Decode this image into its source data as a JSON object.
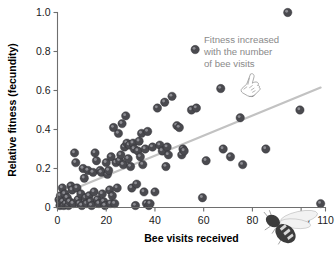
{
  "figure": {
    "name": "bee-visits-fitness-scatterplot",
    "background_color": "#ffffff",
    "point_color": "#4a4a4f",
    "trendline_color": "#c2c2c2",
    "annotation_color": "#8a8a8a",
    "axis_color": "#6e6e6e"
  },
  "annotation": {
    "line1": "Fitness increased",
    "line2": "with the number",
    "line3": "of bee visits",
    "pointer_icon": "pointing-hand-icon"
  },
  "decorations": {
    "bee_icon": "bee-illustration-icon"
  },
  "chart_data": {
    "type": "scatter",
    "title": "",
    "xlabel": "Bee visits received",
    "ylabel": "Relative fitness (fecundity)",
    "xlim": [
      0,
      110
    ],
    "ylim": [
      0,
      1.0
    ],
    "xticks": [
      0,
      20,
      40,
      60,
      80,
      100,
      110
    ],
    "xtick_labels": [
      "0",
      "20",
      "40",
      "60",
      "80",
      "100",
      "110"
    ],
    "yticks": [
      0,
      0.2,
      0.4,
      0.6,
      0.8,
      1.0
    ],
    "ytick_labels": [
      "0",
      "0.2",
      "0.4",
      "0.6",
      "0.8",
      "1.0"
    ],
    "grid": false,
    "legend": false,
    "marker": "filled-circle",
    "marker_size": 4.2,
    "trendline": {
      "type": "linear-fit",
      "x_start": 0,
      "y_start": 0.06,
      "x_end": 108,
      "y_end": 0.615,
      "color": "#c2c2c2"
    },
    "points": [
      [
        0.6,
        0.04
      ],
      [
        1.0,
        0.01
      ],
      [
        1.2,
        0.06
      ],
      [
        1.5,
        0.02
      ],
      [
        2.0,
        0.1
      ],
      [
        2.2,
        0.03
      ],
      [
        2.6,
        0.01
      ],
      [
        3.0,
        0.07
      ],
      [
        3.4,
        0.02
      ],
      [
        4.0,
        0.05
      ],
      [
        4.5,
        0.01
      ],
      [
        5.0,
        0.03
      ],
      [
        5.5,
        0.11
      ],
      [
        6.0,
        0.09
      ],
      [
        6.4,
        0.02
      ],
      [
        7.0,
        0.28
      ],
      [
        7.5,
        0.23
      ],
      [
        8.0,
        0.1
      ],
      [
        8.4,
        0.04
      ],
      [
        9.0,
        0.02
      ],
      [
        9.6,
        0.07
      ],
      [
        10.0,
        0.01
      ],
      [
        10.5,
        0.2
      ],
      [
        11.0,
        0.15
      ],
      [
        11.6,
        0.05
      ],
      [
        12.0,
        0.02
      ],
      [
        12.5,
        0.19
      ],
      [
        13.0,
        0.06
      ],
      [
        13.5,
        0.03
      ],
      [
        14.0,
        0.01
      ],
      [
        14.6,
        0.18
      ],
      [
        15.0,
        0.08
      ],
      [
        15.4,
        0.28
      ],
      [
        16.0,
        0.24
      ],
      [
        16.4,
        0.04
      ],
      [
        17.0,
        0.02
      ],
      [
        17.5,
        0.19
      ],
      [
        18.0,
        0.18
      ],
      [
        18.4,
        0.07
      ],
      [
        19.0,
        0.03
      ],
      [
        19.5,
        0.01
      ],
      [
        20.0,
        0.23
      ],
      [
        20.5,
        0.17
      ],
      [
        21.0,
        0.19
      ],
      [
        21.4,
        0.09
      ],
      [
        21.8,
        0.02
      ],
      [
        22.0,
        0.26
      ],
      [
        22.5,
        0.06
      ],
      [
        23.0,
        0.41
      ],
      [
        23.5,
        0.02
      ],
      [
        24.0,
        0.23
      ],
      [
        24.5,
        0.1
      ],
      [
        25.0,
        0.38
      ],
      [
        25.5,
        0.24
      ],
      [
        26.0,
        0.27
      ],
      [
        26.5,
        0.43
      ],
      [
        27.0,
        0.22
      ],
      [
        27.5,
        0.31
      ],
      [
        28.0,
        0.47
      ],
      [
        28.5,
        0.33
      ],
      [
        29.0,
        0.25
      ],
      [
        29.5,
        0.32
      ],
      [
        30.0,
        0.21
      ],
      [
        30.5,
        0.1
      ],
      [
        31.0,
        0.33
      ],
      [
        31.5,
        0.3
      ],
      [
        32.0,
        0.01
      ],
      [
        32.5,
        0.12
      ],
      [
        33.0,
        0.29
      ],
      [
        33.5,
        0.34
      ],
      [
        34.0,
        0.26
      ],
      [
        34.5,
        0.38
      ],
      [
        35.0,
        0.22
      ],
      [
        35.5,
        0.08
      ],
      [
        36.0,
        0.3
      ],
      [
        36.5,
        0.02
      ],
      [
        37.0,
        0.39
      ],
      [
        37.5,
        0.01
      ],
      [
        38.0,
        0.02
      ],
      [
        39.0,
        0.31
      ],
      [
        40.0,
        0.08
      ],
      [
        41.0,
        0.51
      ],
      [
        42.0,
        0.32
      ],
      [
        43.0,
        0.29
      ],
      [
        44.0,
        0.54
      ],
      [
        44.5,
        0.21
      ],
      [
        45.0,
        0.31
      ],
      [
        45.5,
        0.27
      ],
      [
        47.0,
        0.57
      ],
      [
        49.0,
        0.42
      ],
      [
        50.0,
        0.41
      ],
      [
        51.0,
        0.27
      ],
      [
        51.5,
        0.3
      ],
      [
        52.0,
        0.29
      ],
      [
        55.0,
        0.5
      ],
      [
        56.5,
        0.81
      ],
      [
        57.0,
        0.51
      ],
      [
        59.5,
        0.05
      ],
      [
        61.0,
        0.24
      ],
      [
        67.0,
        0.61
      ],
      [
        68.0,
        0.3
      ],
      [
        71.0,
        0.26
      ],
      [
        75.0,
        0.46
      ],
      [
        76.0,
        0.22
      ],
      [
        79.5,
        0.59
      ],
      [
        85.5,
        0.3
      ],
      [
        94.5,
        1.0
      ],
      [
        99.5,
        0.5
      ],
      [
        108.0,
        0.02
      ]
    ]
  }
}
